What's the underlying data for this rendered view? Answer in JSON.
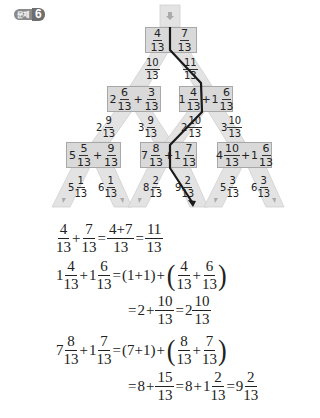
{
  "badge": {
    "label": "문제",
    "number": "6"
  },
  "tree": {
    "top": {
      "a": {
        "n": "4",
        "d": "13"
      },
      "op": "+",
      "b": {
        "n": "7",
        "d": "13"
      }
    },
    "level1_results": [
      {
        "n": "10",
        "d": "13"
      },
      {
        "n": "11",
        "d": "13"
      }
    ],
    "level2": [
      {
        "aw": "2",
        "a": {
          "n": "6",
          "d": "13"
        },
        "op": "+",
        "bw": "",
        "b": {
          "n": "3",
          "d": "13"
        }
      },
      {
        "aw": "1",
        "a": {
          "n": "4",
          "d": "13"
        },
        "op": "+",
        "bw": "1",
        "b": {
          "n": "6",
          "d": "13"
        }
      }
    ],
    "level2_results": [
      {
        "w": "2",
        "n": "9",
        "d": "13"
      },
      {
        "w": "3",
        "n": "9",
        "d": "13"
      },
      {
        "w": "2",
        "n": "10",
        "d": "13"
      },
      {
        "w": "3",
        "n": "10",
        "d": "13"
      }
    ],
    "level3": [
      {
        "aw": "5",
        "a": {
          "n": "5",
          "d": "13"
        },
        "op": "+",
        "bw": "",
        "b": {
          "n": "9",
          "d": "13"
        }
      },
      {
        "aw": "7",
        "a": {
          "n": "8",
          "d": "13"
        },
        "op": "+",
        "bw": "1",
        "b": {
          "n": "7",
          "d": "13"
        }
      },
      {
        "aw": "4",
        "a": {
          "n": "10",
          "d": "13"
        },
        "op": "+",
        "bw": "1",
        "b": {
          "n": "6",
          "d": "13"
        }
      }
    ],
    "level3_results": [
      {
        "w": "5",
        "n": "1",
        "d": "13"
      },
      {
        "w": "6",
        "n": "1",
        "d": "13"
      },
      {
        "w": "8",
        "n": "2",
        "d": "13"
      },
      {
        "w": "9",
        "n": "2",
        "d": "13"
      },
      {
        "w": "5",
        "n": "3",
        "d": "13"
      },
      {
        "w": "6",
        "n": "3",
        "d": "13"
      }
    ],
    "colors": {
      "path": "#1a1a1a",
      "box": "#d9d9d9",
      "branch": "#e3e3e3",
      "border": "#a8a8a8"
    }
  },
  "equations": {
    "eq1": {
      "a": {
        "n": "4",
        "d": "13"
      },
      "op1": "+",
      "b": {
        "n": "7",
        "d": "13"
      },
      "eq1": "=",
      "c": {
        "n": "4+7",
        "d": "13"
      },
      "eq2": "=",
      "r": {
        "n": "11",
        "d": "13"
      }
    },
    "eq2_line1": {
      "aw": "1",
      "a": {
        "n": "4",
        "d": "13"
      },
      "op": "+",
      "bw": "1",
      "b": {
        "n": "6",
        "d": "13"
      },
      "eq": "=",
      "whole_sum": "(1+1)",
      "plus": "+",
      "c": {
        "n": "4",
        "d": "13"
      },
      "inner_op": "+",
      "e": {
        "n": "6",
        "d": "13"
      }
    },
    "eq2_line2": {
      "eq": "=",
      "w": "2",
      "plus": "+",
      "f": {
        "n": "10",
        "d": "13"
      },
      "eq2": "=",
      "rw": "2",
      "r": {
        "n": "10",
        "d": "13"
      }
    },
    "eq3_line1": {
      "aw": "7",
      "a": {
        "n": "8",
        "d": "13"
      },
      "op": "+",
      "bw": "1",
      "b": {
        "n": "7",
        "d": "13"
      },
      "eq": "=",
      "whole_sum": "(7+1)",
      "plus": "+",
      "c": {
        "n": "8",
        "d": "13"
      },
      "inner_op": "+",
      "e": {
        "n": "7",
        "d": "13"
      }
    },
    "eq3_line2": {
      "eq": "=",
      "w": "8",
      "plus": "+",
      "f": {
        "n": "15",
        "d": "13"
      },
      "eq2": "=",
      "w2": "8",
      "plus2": "+",
      "gw": "1",
      "g": {
        "n": "2",
        "d": "13"
      },
      "eq3": "=",
      "rw": "9",
      "r": {
        "n": "2",
        "d": "13"
      }
    }
  }
}
